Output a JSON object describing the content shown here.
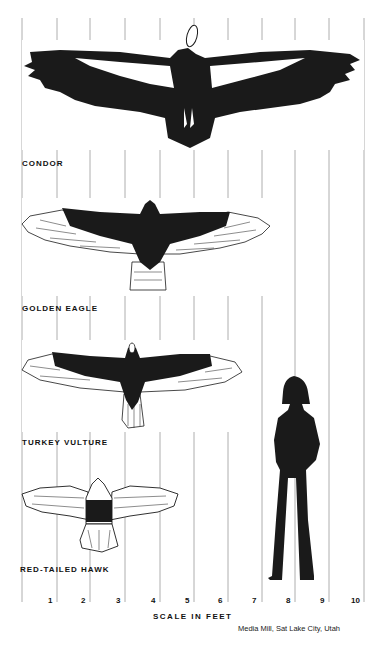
{
  "figure": {
    "axis_title": "SCALE IN FEET",
    "credit": "Media Mill, Sat Lake City, Utah",
    "ticks": [
      "1",
      "2",
      "3",
      "4",
      "5",
      "6",
      "7",
      "8",
      "9",
      "10"
    ],
    "grid_color": "#9a9a9a",
    "ink_color": "#1a1a1a"
  },
  "birds": [
    {
      "name": "CONDOR",
      "wingspan_ft": 9.8
    },
    {
      "name": "GOLDEN EAGLE",
      "wingspan_ft": 7.3
    },
    {
      "name": "TURKEY VULTURE",
      "wingspan_ft": 6.2
    },
    {
      "name": "RED-TAILED HAWK",
      "wingspan_ft": 4.5
    }
  ],
  "human": {
    "label": "human silhouette",
    "height_ft": 6.0
  }
}
